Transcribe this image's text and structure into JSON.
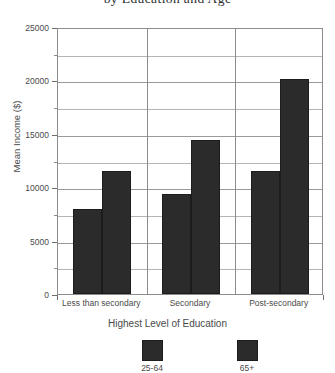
{
  "chart_data": {
    "type": "bar",
    "title": "by Education and Age",
    "xlabel": "Highest Level of Education",
    "ylabel": "Mean Income ($)",
    "categories": [
      "Less than secondary",
      "Secondary",
      "Post-secondary"
    ],
    "series": [
      {
        "name": "25-64",
        "values": [
          7950,
          9350,
          11500
        ]
      },
      {
        "name": "65+",
        "values": [
          11500,
          14400,
          20100
        ]
      }
    ],
    "ylim": [
      0,
      25000
    ],
    "ytick_labels": [
      "0",
      "5000",
      "10000",
      "15000",
      "20000",
      "25000"
    ],
    "ytick_values": [
      0,
      5000,
      10000,
      15000,
      20000,
      25000
    ],
    "minor_tick_values": [
      2500,
      7500,
      12500,
      17500,
      22500
    ],
    "grid": true,
    "legend_position": "bottom",
    "bar_color": "#2b2b2b",
    "axis_color": "#8c8c8c"
  }
}
